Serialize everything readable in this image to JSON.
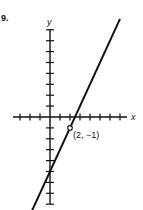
{
  "problem_number": "9.",
  "chart_data": {
    "type": "line",
    "title": "",
    "xlabel": "x",
    "ylabel": "y",
    "equation": "y = 2x - 5",
    "series": [
      {
        "name": "line",
        "x": [
          -1.8,
          7
        ],
        "y": [
          -8.6,
          9
        ]
      }
    ],
    "annotations": [
      {
        "x": 2,
        "y": -1,
        "label": "(2, −1)",
        "marker": "open-circle"
      }
    ],
    "xlim": [
      -4,
      7
    ],
    "ylim": [
      -9,
      8
    ],
    "grid": false,
    "ticks_unit": 1
  }
}
